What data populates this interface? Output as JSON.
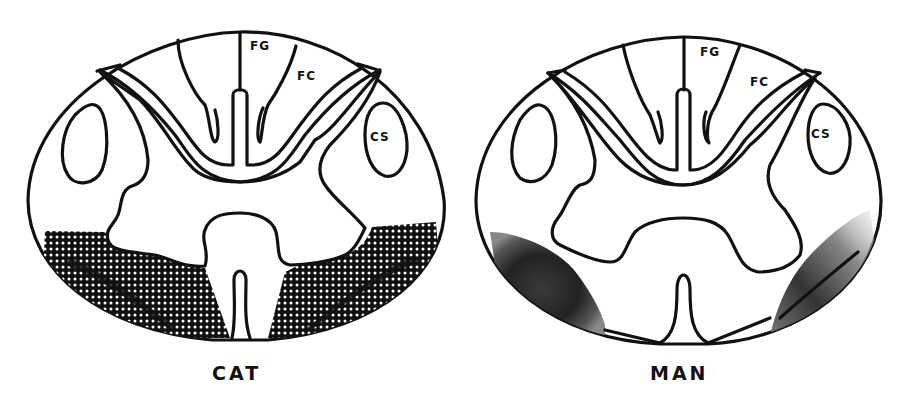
{
  "figure": {
    "panels": [
      {
        "id": "cat",
        "species_label": "CAT",
        "regions": {
          "fasciculus_gracilis": "FG",
          "fasciculus_cuneatus": "FC",
          "corticospinal": "CS"
        },
        "lesion_pattern": "stippled-dots",
        "lesion_location": "bilateral ventrolateral white matter"
      },
      {
        "id": "man",
        "species_label": "MAN",
        "regions": {
          "fasciculus_gracilis": "FG",
          "fasciculus_cuneatus": "FC",
          "corticospinal": "CS"
        },
        "lesion_pattern": "gradient-shading",
        "lesion_location": "bilateral ventrolateral white matter"
      }
    ],
    "colors": {
      "ink": "#111111",
      "background": "#ffffff",
      "stipple_dot": "#ffffff",
      "shade_dark": "#222222",
      "shade_mid": "#8a8a8a"
    }
  }
}
